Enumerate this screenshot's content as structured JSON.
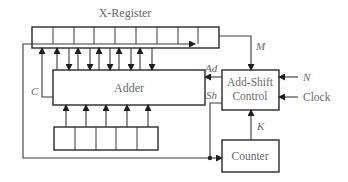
{
  "diagram": {
    "title": "X-Register",
    "blocks": {
      "x_register": {
        "label": "X-Register",
        "cells": 9
      },
      "adder": {
        "label": "Adder"
      },
      "y_register": {
        "label": "",
        "cells": 5
      },
      "control": {
        "label_line1": "Add-Shift",
        "label_line2": "Control"
      },
      "counter": {
        "label": "Counter"
      }
    },
    "signals": {
      "m": "M",
      "ad": "Ad",
      "sh": "Sh",
      "c": "C",
      "n": "N",
      "clock": "Clock",
      "k": "K"
    },
    "colors": {
      "line": "#3a3a3a",
      "text": "#6a6a6a",
      "background": "#ffffff"
    }
  }
}
